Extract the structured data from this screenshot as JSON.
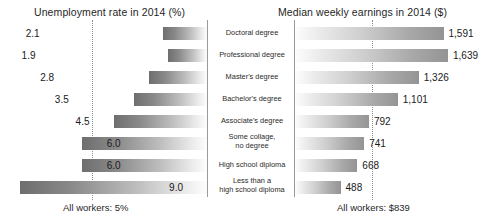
{
  "chart_data": {
    "type": "bar",
    "categories": [
      "Doctoral degree",
      "Professional degree",
      "Master's degree",
      "Bachelor's degree",
      "Associate's degree",
      "Some collage, no degree",
      "High school diploma",
      "Less than a high school diploma"
    ],
    "panels": [
      {
        "id": "unemployment",
        "title": "Unemployment rate in 2014 (%)",
        "xlabel": "",
        "ylabel": "",
        "direction": "left",
        "unit": "%",
        "values": [
          2.1,
          1.9,
          2.8,
          3.5,
          4.5,
          6.0,
          6.0,
          9.0
        ],
        "value_labels": [
          "2.1",
          "1.9",
          "2.8",
          "3.5",
          "4.5",
          "6.0",
          "6.0",
          "9.0"
        ],
        "reference": {
          "label": "All workers: 5%",
          "value": 5
        },
        "xlim": [
          0,
          10
        ],
        "grid": false
      },
      {
        "id": "earnings",
        "title": "Median weekly earnings in 2014 ($)",
        "xlabel": "",
        "ylabel": "",
        "direction": "right",
        "unit": "$",
        "values": [
          1591,
          1639,
          1326,
          1101,
          792,
          741,
          668,
          488
        ],
        "value_labels": [
          "1,591",
          "1,639",
          "1,326",
          "1,101",
          "792",
          "741",
          "668",
          "488"
        ],
        "reference": {
          "label": "All workers: $839",
          "value": 839
        },
        "xlim": [
          0,
          1800
        ],
        "grid": false
      }
    ],
    "legend": "none",
    "legend_position": "none"
  },
  "left_panel": {
    "title": "Unemployment rate in 2014 (%)",
    "footer": "All workers: 5%",
    "rows": [
      {
        "value": "2.1"
      },
      {
        "value": "1.9"
      },
      {
        "value": "2.8"
      },
      {
        "value": "3.5"
      },
      {
        "value": "4.5"
      },
      {
        "value": "6.0"
      },
      {
        "value": "6.0"
      },
      {
        "value": "9.0"
      }
    ]
  },
  "right_panel": {
    "title": "Median weekly earnings in 2014 ($)",
    "footer": "All workers: $839",
    "rows": [
      {
        "value": "1,591"
      },
      {
        "value": "1,639"
      },
      {
        "value": "1,326"
      },
      {
        "value": "1,101"
      },
      {
        "value": "792"
      },
      {
        "value": "741"
      },
      {
        "value": "668"
      },
      {
        "value": "488"
      }
    ]
  },
  "center_labels": [
    {
      "line1": "Doctoral degree",
      "line2": ""
    },
    {
      "line1": "Professional degree",
      "line2": ""
    },
    {
      "line1": "Master's degree",
      "line2": ""
    },
    {
      "line1": "Bachelor's degree",
      "line2": ""
    },
    {
      "line1": "Associate's degree",
      "line2": ""
    },
    {
      "line1": "Some collage,",
      "line2": "no degree"
    },
    {
      "line1": "High school diploma",
      "line2": ""
    },
    {
      "line1": "Less than a",
      "line2": "high school diploma"
    }
  ],
  "colors": {
    "bar_dark": "#6e6e6e",
    "bar_light": "#fdfdfd",
    "divider": "#9a9a9a",
    "reference_line": "#8d8d8d",
    "text": "#1a1a1a",
    "background": "#ffffff"
  }
}
